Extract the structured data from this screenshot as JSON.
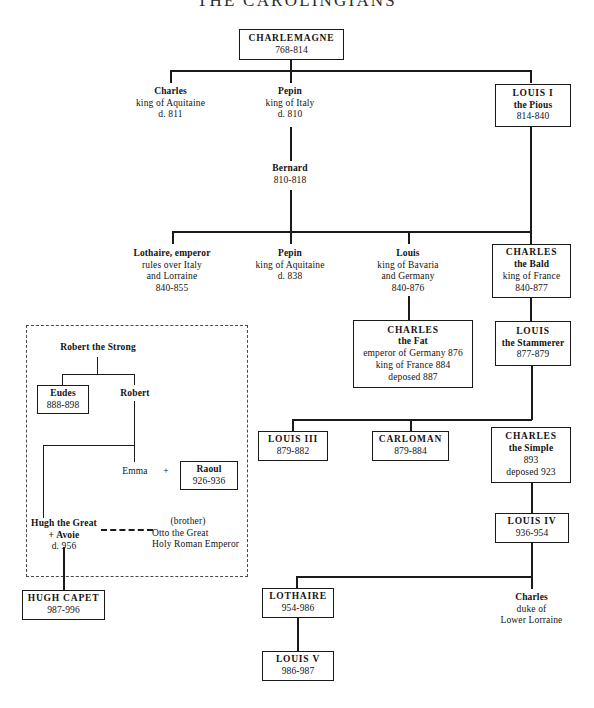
{
  "title": "THE CAROLINGIANS",
  "nodes": {
    "charlemagne": {
      "name": "CHARLEMAGNE",
      "dates": "768-814"
    },
    "charles_aquitaine": {
      "name": "Charles",
      "role": "king of Aquitaine",
      "dates": "d. 811"
    },
    "pepin_italy": {
      "name": "Pepin",
      "role": "king of Italy",
      "dates": "d. 810"
    },
    "louis_i": {
      "name": "LOUIS I",
      "epithet": "the Pious",
      "dates": "814-840"
    },
    "bernard": {
      "name": "Bernard",
      "dates": "810-818"
    },
    "lothaire_emperor": {
      "name": "Lothaire, emperor",
      "role1": "rules over Italy",
      "role2": "and Lorraine",
      "dates": "840-855"
    },
    "pepin_aquitaine": {
      "name": "Pepin",
      "role": "king of Aquitaine",
      "dates": "d. 838"
    },
    "louis_bavaria": {
      "name": "Louis",
      "role1": "king of Bavaria",
      "role2": "and Germany",
      "dates": "840-876"
    },
    "charles_bald": {
      "name": "CHARLES",
      "epithet": "the Bald",
      "role": "king of France",
      "dates": "840-877"
    },
    "charles_fat": {
      "name": "CHARLES",
      "epithet": "the Fat",
      "role1": "emperor of Germany 876",
      "role2": "king of France 884",
      "role3": "deposed 887"
    },
    "louis_stammerer": {
      "name": "LOUIS",
      "epithet": "the Stammerer",
      "dates": "877-879"
    },
    "louis_iii": {
      "name": "LOUIS III",
      "dates": "879-882"
    },
    "carloman": {
      "name": "CARLOMAN",
      "dates": "879-884"
    },
    "charles_simple": {
      "name": "CHARLES",
      "epithet": "the Simple",
      "dates": "893",
      "note": "deposed 923"
    },
    "louis_iv": {
      "name": "LOUIS IV",
      "dates": "936-954"
    },
    "lothaire": {
      "name": "LOTHAIRE",
      "dates": "954-986"
    },
    "louis_v": {
      "name": "LOUIS V",
      "dates": "986-987"
    },
    "charles_lorraine": {
      "name": "Charles",
      "role1": "duke of",
      "role2": "Lower Lorraine"
    },
    "robert_strong": {
      "name": "Robert the Strong"
    },
    "eudes": {
      "name": "Eudes",
      "dates": "888-898"
    },
    "robert": {
      "name": "Robert"
    },
    "emma": {
      "name": "Emma"
    },
    "plus_sign": {
      "symbol": "+"
    },
    "raoul": {
      "name": "Raoul",
      "dates": "926-936"
    },
    "hugh_great": {
      "name": "Hugh the Great",
      "spouse": "+ Avoie",
      "dates": "d. 956"
    },
    "otto_great": {
      "relation": "(brother)",
      "name": "Otto the Great",
      "title": "Holy Roman Emperor"
    },
    "hugh_capet": {
      "name": "HUGH CAPET",
      "dates": "987-996"
    }
  },
  "colors": {
    "ink": "#1a1a1a",
    "box_border": "#1a1a1a",
    "dashed_border": "#4a4a4a",
    "background": "#ffffff"
  }
}
